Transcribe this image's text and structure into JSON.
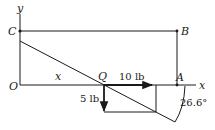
{
  "figure": {
    "points": {
      "O": {
        "label": "O",
        "x": 20,
        "y": 85
      },
      "C": {
        "label": "C",
        "x": 20,
        "y": 31
      },
      "B": {
        "label": "B",
        "x": 177,
        "y": 31
      },
      "A": {
        "label": "A",
        "x": 177,
        "y": 85
      },
      "Q": {
        "label": "Q",
        "x": 104,
        "y": 85
      }
    },
    "axes": {
      "x_label": "x",
      "y_label": "y"
    },
    "segment_label": "x",
    "forces": {
      "horizontal": {
        "label": "10 lb",
        "magnitude": 10,
        "unit": "lb",
        "direction": "right"
      },
      "vertical": {
        "label": "5 lb",
        "magnitude": 5,
        "unit": "lb",
        "direction": "down"
      }
    },
    "angle": {
      "label": "26.6°",
      "value": 26.6
    }
  },
  "colors": {
    "ink": "#1a1a1a",
    "background": "#ffffff"
  }
}
